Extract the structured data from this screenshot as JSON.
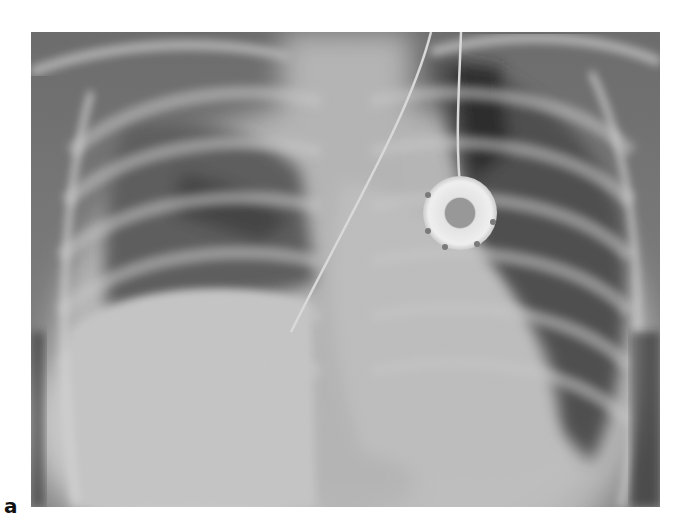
{
  "figure": {
    "panel_label": "a",
    "image": {
      "subject": "chest radiograph (frontal view)",
      "features": [
        "rib cage",
        "right lung field",
        "left lung field",
        "mediastinum / spine",
        "cardiac silhouette",
        "diaphragm domes",
        "implanted port device",
        "catheter line"
      ],
      "icon": "xray-image-icon"
    }
  }
}
